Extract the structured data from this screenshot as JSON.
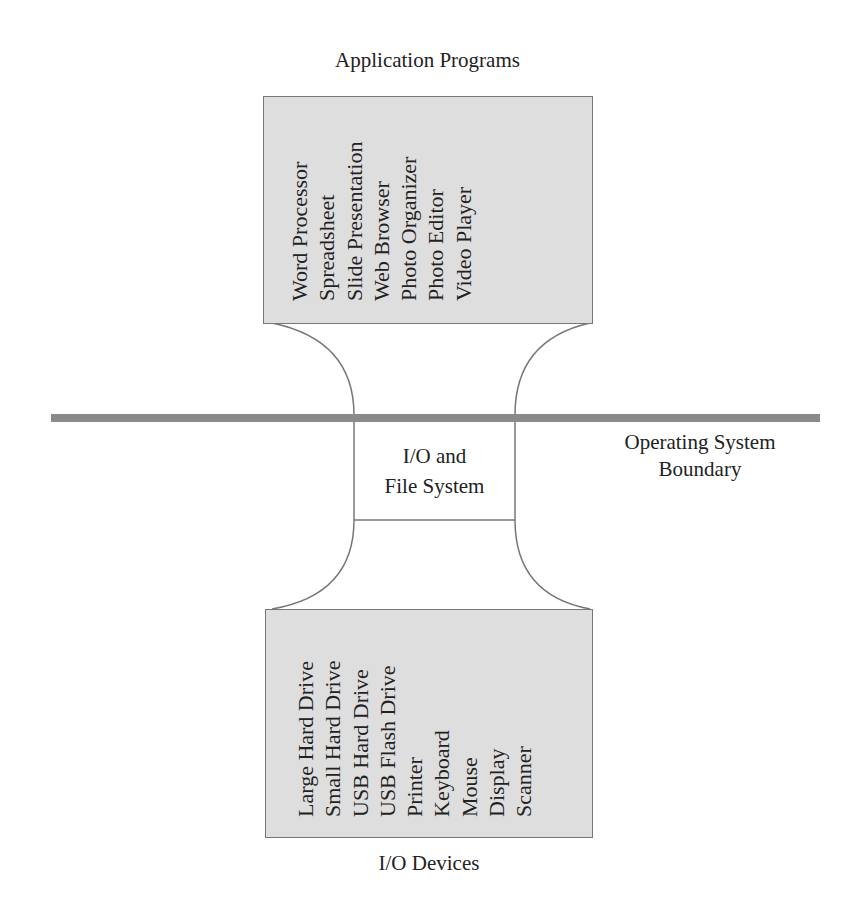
{
  "diagram": {
    "top_label": "Application Programs",
    "applications": [
      "Word Processor",
      "Spreadsheet",
      "Slide Presentation",
      "Web Browser",
      "Photo Organizer",
      "Photo Editor",
      "Video Player"
    ],
    "middle_box_line1": "I/O and",
    "middle_box_line2": "File System",
    "boundary_label_line1": "Operating System",
    "boundary_label_line2": "Boundary",
    "devices": [
      "Large Hard Drive",
      "Small Hard Drive",
      "USB Hard Drive",
      "USB Flash Drive",
      "Printer",
      "Keyboard",
      "Mouse",
      "Display",
      "Scanner"
    ],
    "bottom_label": "I/O Devices",
    "colors": {
      "box_fill": "#dedede",
      "boundary_bar": "#8a8a8a",
      "stroke": "#777777"
    }
  }
}
